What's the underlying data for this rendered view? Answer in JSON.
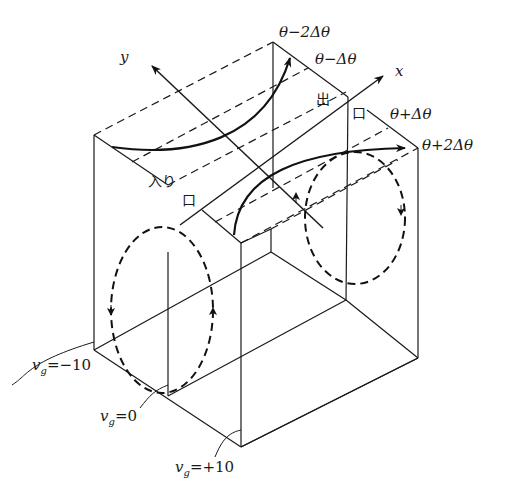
{
  "figure": {
    "axes": {
      "x_label": "x",
      "y_label": "y"
    },
    "theta_labels": [
      "θ−2Δθ",
      "θ−Δθ",
      "θ+Δθ",
      "θ+2Δθ"
    ],
    "inlet_label": [
      "入り",
      "口"
    ],
    "outlet_label": [
      "出",
      "口"
    ],
    "vg_labels": {
      "minus10": {
        "sym": "v",
        "sub": "g",
        "val": "=−10"
      },
      "zero": {
        "sym": "v",
        "sub": "g",
        "val": "=0"
      },
      "plus10": {
        "sym": "v",
        "sub": "g",
        "val": "=+10"
      }
    },
    "colors": {
      "line": "#1a1a1a",
      "background": "#ffffff"
    }
  }
}
